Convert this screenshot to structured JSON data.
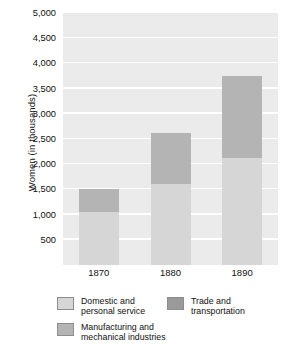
{
  "chart_data": {
    "type": "bar",
    "subtype": "stacked-bar",
    "title": "",
    "xlabel": "",
    "ylabel": "Women (in thousands)",
    "categories": [
      "1870",
      "1880",
      "1890"
    ],
    "series": [
      {
        "name": "Domestic and\npersonal service",
        "color": "#d6d6d6",
        "values": [
          1050,
          1600,
          2120
        ]
      },
      {
        "name": "Manufacturing and\nmechanical industries",
        "color": "#b4b4b4",
        "values": [
          450,
          1020,
          1630
        ]
      },
      {
        "name": "Trade and\ntransportation",
        "color": "#9a9a9a",
        "values": [
          0,
          0,
          0
        ]
      }
    ],
    "totals": [
      1500,
      2620,
      3750
    ],
    "ylim": [
      0,
      5000
    ],
    "y_ticks": [
      500,
      1000,
      1500,
      2000,
      2500,
      3000,
      3500,
      4000,
      4500,
      5000
    ],
    "y_tick_labels": [
      "500",
      "1,000",
      "1,500",
      "2,000",
      "2,500",
      "3,000",
      "3,500",
      "4,000",
      "4,500",
      "5,000"
    ],
    "grid": true,
    "legend_position": "bottom",
    "plot_background": "#ebebeb",
    "gridline_color": "#ffffff"
  },
  "axes": {
    "y_title": "Women (in thousands)"
  },
  "legend": {
    "items": [
      {
        "label": "Domestic and\npersonal service",
        "color": "#d6d6d6"
      },
      {
        "label": "Trade and\ntransportation",
        "color": "#9a9a9a"
      },
      {
        "label": "Manufacturing and\nmechanical industries",
        "color": "#b4b4b4"
      }
    ]
  }
}
